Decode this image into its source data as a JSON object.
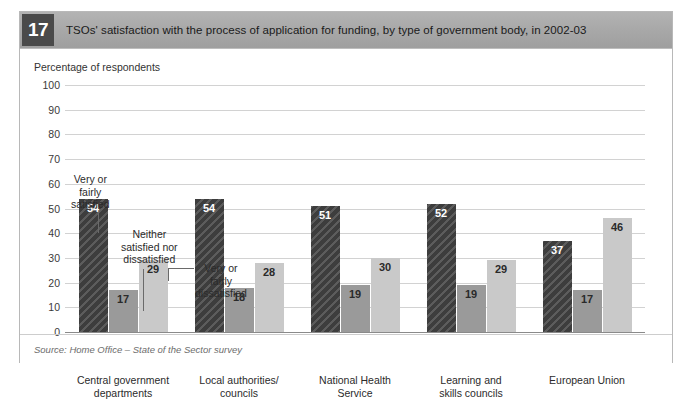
{
  "figure": {
    "number": "17",
    "title": "TSOs' satisfaction with the process of application for funding, by type of government body, in 2002-03",
    "source": "Source: Home Office – State of the Sector survey"
  },
  "colors": {
    "header_bar": "#a9a9a9",
    "number_badge": "#4a4a4a",
    "satisfied": "#3d3d3d",
    "neither": "#9a9a9a",
    "dissatisfied": "#c9c9c9",
    "gridline": "#d2d2d2",
    "frame": "#b8b8b8"
  },
  "annotations": [
    {
      "name": "very-or-fairly-satisfied",
      "lines": [
        "Very or",
        "fairly",
        "satisfied"
      ]
    },
    {
      "name": "neither-satisfied-nor-dissatisfied",
      "lines": [
        "Neither",
        "satisfied nor",
        "dissatisfied"
      ]
    },
    {
      "name": "very-or-fairly-dissatisfied",
      "lines": [
        "Very or",
        "fairly",
        "dissatisfied"
      ]
    }
  ],
  "chart_data": {
    "type": "bar",
    "title": "TSOs' satisfaction with the process of application for funding, by type of government body, in 2002-03",
    "xlabel": "",
    "ylabel": "Percentage of respondents",
    "ylim": [
      0,
      100
    ],
    "yticks": [
      100,
      90,
      80,
      70,
      60,
      50,
      40,
      30,
      20,
      10,
      0
    ],
    "grid": true,
    "legend_position": "annotated-callouts",
    "categories": [
      [
        "Central government",
        "departments"
      ],
      [
        "Local authorities/",
        "councils"
      ],
      [
        "National Health",
        "Service"
      ],
      [
        "Learning and",
        "skills councils"
      ],
      [
        "European Union",
        ""
      ]
    ],
    "series": [
      {
        "name": "Very or fairly satisfied",
        "values": [
          54,
          54,
          51,
          52,
          37
        ]
      },
      {
        "name": "Neither satisfied nor dissatisfied",
        "values": [
          17,
          18,
          19,
          19,
          17
        ]
      },
      {
        "name": "Very or fairly dissatisfied",
        "values": [
          29,
          28,
          30,
          29,
          46
        ]
      }
    ]
  }
}
